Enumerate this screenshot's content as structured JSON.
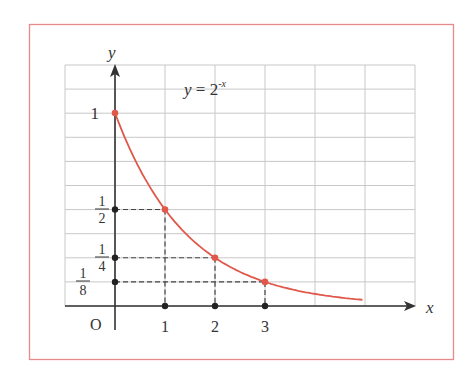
{
  "chart_data": {
    "type": "line",
    "equation_label": {
      "base": "y = 2",
      "exponent": "-x"
    },
    "xlabel": "x",
    "ylabel": "y",
    "origin_label": "O",
    "x_ticks": [
      "1",
      "2",
      "3"
    ],
    "y_ticks": [
      {
        "num": "1",
        "den": "8",
        "value": 0.125
      },
      {
        "num": "1",
        "den": "4",
        "value": 0.25
      },
      {
        "num": "1",
        "den": "2",
        "value": 0.5
      },
      {
        "num": "1",
        "den": "",
        "value": 1
      }
    ],
    "points": [
      {
        "x": 0,
        "y": 1
      },
      {
        "x": 1,
        "y": 0.5
      },
      {
        "x": 2,
        "y": 0.25
      },
      {
        "x": 3,
        "y": 0.125
      }
    ],
    "curve_domain": [
      0,
      4.95
    ],
    "xlim": [
      -1,
      6
    ],
    "ylim": [
      0,
      1.25
    ],
    "grid": true,
    "colors": {
      "curve": "#e0584a",
      "frame": "#e88a8a",
      "axis": "#333333",
      "grid": "#c8c8c8"
    }
  }
}
